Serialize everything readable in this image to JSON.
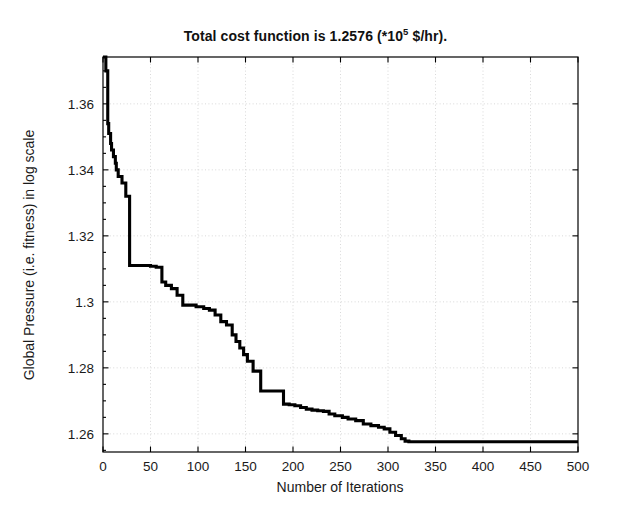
{
  "figure": {
    "background": "#ffffff",
    "line_color": "#000000",
    "axis_color": "#000000",
    "grid_color": "#cfcfcf"
  },
  "title": {
    "prefix": "Total cost function is  1.2576 (*10",
    "exponent": "5",
    "suffix": " $/hr)."
  },
  "axes": {
    "x_label": "Number of Iterations",
    "y_label": "Global Pressure (i.e. fitness) in log scale",
    "x_ticks": [
      "0",
      "50",
      "100",
      "150",
      "200",
      "250",
      "300",
      "350",
      "400",
      "450",
      "500"
    ],
    "y_ticks": [
      "1.26",
      "1.28",
      "1.3",
      "1.32",
      "1.34",
      "1.36"
    ]
  },
  "chart_data": {
    "type": "line",
    "xlabel": "Number of Iterations",
    "ylabel": "Global Pressure (i.e. fitness) in log scale",
    "xlim": [
      0,
      500
    ],
    "ylim": [
      1.2545,
      1.3742
    ],
    "xticks": [
      0,
      50,
      100,
      150,
      200,
      250,
      300,
      350,
      400,
      450,
      500
    ],
    "yticks": [
      1.26,
      1.28,
      1.3,
      1.32,
      1.34,
      1.36
    ],
    "grid": true,
    "legend": "none",
    "series": [
      {
        "name": "Global best fitness",
        "drawstyle": "steps-post",
        "x": [
          0,
          3,
          5,
          6,
          8,
          9,
          11,
          13,
          14,
          16,
          20,
          24,
          28,
          44,
          50,
          56,
          62,
          66,
          72,
          78,
          84,
          98,
          106,
          112,
          118,
          124,
          130,
          136,
          140,
          144,
          148,
          152,
          158,
          166,
          182,
          190,
          196,
          202,
          208,
          214,
          220,
          226,
          232,
          238,
          244,
          252,
          258,
          266,
          274,
          282,
          290,
          296,
          302,
          308,
          314,
          318,
          322,
          340,
          380,
          420,
          460,
          500
        ],
        "y": [
          1.3742,
          1.37,
          1.354,
          1.351,
          1.348,
          1.346,
          1.344,
          1.342,
          1.34,
          1.338,
          1.336,
          1.332,
          1.311,
          1.311,
          1.3108,
          1.3105,
          1.306,
          1.305,
          1.304,
          1.302,
          1.299,
          1.2985,
          1.298,
          1.2975,
          1.296,
          1.294,
          1.293,
          1.29,
          1.288,
          1.286,
          1.284,
          1.282,
          1.279,
          1.273,
          1.273,
          1.269,
          1.2688,
          1.2685,
          1.268,
          1.2675,
          1.2672,
          1.267,
          1.2668,
          1.266,
          1.2655,
          1.265,
          1.2645,
          1.264,
          1.263,
          1.2625,
          1.262,
          1.2615,
          1.2605,
          1.2595,
          1.2585,
          1.2578,
          1.2576,
          1.2576,
          1.2576,
          1.2576,
          1.2576,
          1.2576
        ]
      }
    ]
  },
  "plot_geometry": {
    "left": 103,
    "top": 57,
    "right": 578,
    "bottom": 452
  }
}
